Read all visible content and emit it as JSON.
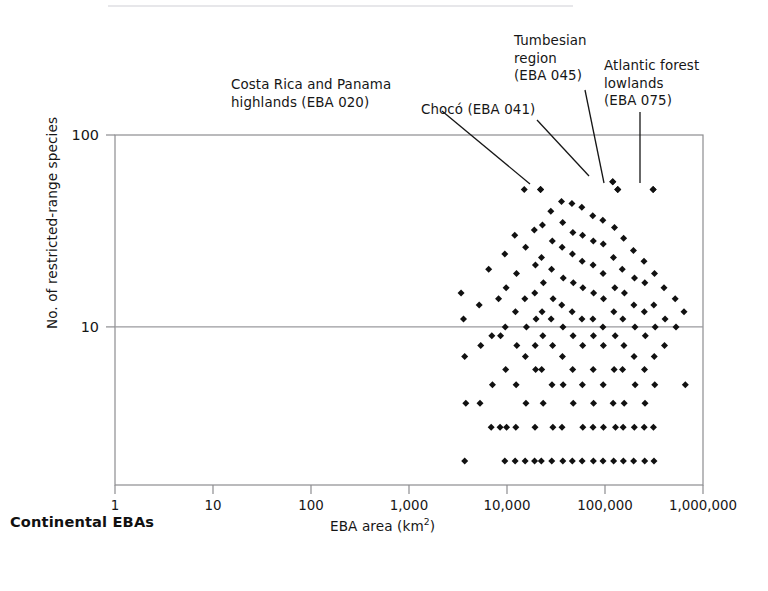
{
  "figure": {
    "corner_caption": "Continental EBAs",
    "frame": {
      "left": 115,
      "top": 135,
      "right": 703,
      "bottom": 485
    },
    "colors": {
      "marker": "#111111",
      "frame": "#8d8d90",
      "gridline": "#9a9a9e",
      "leader": "#161616",
      "text": "#161616",
      "background": "#ffffff",
      "scan_artifact": "#e7e7ea"
    }
  },
  "chart_data": {
    "type": "scatter",
    "title": "",
    "subtitle": "",
    "xlabel": "EBA area (km2)",
    "xlabel_base": "EBA area (km",
    "xlabel_sup": "2",
    "xlabel_tail": ")",
    "ylabel": "No. of restricted-range species",
    "xscale": "log",
    "yscale": "log",
    "xlim": [
      1,
      1000000
    ],
    "ylim": [
      1.5,
      100
    ],
    "xticks": [
      1,
      10,
      100,
      1000,
      10000,
      100000,
      1000000
    ],
    "xtick_labels": [
      "1",
      "10",
      "100",
      "1,000",
      "10,000",
      "100,000",
      "1,000,000"
    ],
    "yticks": [
      10,
      100
    ],
    "ytick_labels": [
      "10",
      "100"
    ],
    "grid": "horizontal-at-y-10",
    "legend": null,
    "legend_position": "none",
    "marker_symbol": "diamond",
    "marker_size_px": 7,
    "n_points": 124,
    "annotations": [
      {
        "id": "costa-rica-panama-highlands",
        "text": "Costa Rica and Panama\nhighlands (EBA 020)",
        "eba_code": "EBA 020",
        "point": {
          "x": 22000,
          "y": 52
        },
        "leader_px": [
          [
            442,
            111
          ],
          [
            530,
            184
          ]
        ]
      },
      {
        "id": "choco",
        "text": "Chocó (EBA 041)",
        "eba_code": "EBA 041",
        "point": {
          "x": 120000,
          "y": 57
        },
        "leader_px": [
          [
            537,
            120
          ],
          [
            589,
            176
          ]
        ]
      },
      {
        "id": "tumbesian-region",
        "text": "Tumbesian\nregion\n(EBA 045)",
        "eba_code": "EBA 045",
        "point": {
          "x": 135000,
          "y": 52
        },
        "leader_px": [
          [
            585,
            90
          ],
          [
            604,
            183
          ]
        ]
      },
      {
        "id": "atlantic-forest-lowlands",
        "text": "Atlantic forest\nlowlands\n(EBA 075)",
        "eba_code": "EBA 075",
        "point": {
          "x": 310000,
          "y": 52
        },
        "leader_px": [
          [
            640,
            112
          ],
          [
            640,
            183
          ]
        ]
      }
    ],
    "points": [
      [
        3400,
        15
      ],
      [
        3600,
        11
      ],
      [
        3700,
        7
      ],
      [
        3800,
        4
      ],
      [
        3700,
        2
      ],
      [
        5200,
        13
      ],
      [
        5400,
        8
      ],
      [
        5300,
        4
      ],
      [
        6500,
        20
      ],
      [
        7000,
        9
      ],
      [
        7100,
        5
      ],
      [
        6900,
        3
      ],
      [
        8200,
        14
      ],
      [
        8600,
        9
      ],
      [
        8500,
        3
      ],
      [
        9500,
        24
      ],
      [
        9800,
        16
      ],
      [
        9600,
        10
      ],
      [
        9700,
        6
      ],
      [
        9900,
        3
      ],
      [
        9500,
        2
      ],
      [
        12000,
        30
      ],
      [
        12500,
        19
      ],
      [
        12200,
        12
      ],
      [
        12600,
        8
      ],
      [
        12400,
        5
      ],
      [
        12300,
        3
      ],
      [
        12100,
        2
      ],
      [
        15000,
        52
      ],
      [
        15500,
        26
      ],
      [
        15200,
        14
      ],
      [
        15800,
        10
      ],
      [
        15400,
        7
      ],
      [
        15600,
        4
      ],
      [
        15300,
        2
      ],
      [
        19000,
        32
      ],
      [
        19500,
        21
      ],
      [
        19200,
        15
      ],
      [
        19800,
        11
      ],
      [
        19400,
        8
      ],
      [
        19600,
        6
      ],
      [
        19300,
        3
      ],
      [
        19100,
        2
      ],
      [
        22000,
        52
      ],
      [
        23000,
        34
      ],
      [
        22500,
        23
      ],
      [
        23500,
        17
      ],
      [
        22800,
        12
      ],
      [
        23200,
        9
      ],
      [
        22600,
        6
      ],
      [
        23400,
        4
      ],
      [
        22400,
        2
      ],
      [
        28000,
        40
      ],
      [
        29000,
        28
      ],
      [
        28500,
        20
      ],
      [
        29500,
        14
      ],
      [
        28200,
        11
      ],
      [
        29200,
        8
      ],
      [
        28800,
        5
      ],
      [
        29400,
        3
      ],
      [
        28600,
        2
      ],
      [
        36000,
        45
      ],
      [
        37000,
        35
      ],
      [
        36500,
        26
      ],
      [
        37500,
        18
      ],
      [
        36200,
        13
      ],
      [
        37200,
        10
      ],
      [
        36800,
        7
      ],
      [
        37400,
        5
      ],
      [
        36400,
        3
      ],
      [
        37100,
        2
      ],
      [
        46000,
        44
      ],
      [
        47000,
        31
      ],
      [
        46500,
        24
      ],
      [
        47500,
        17
      ],
      [
        46200,
        12
      ],
      [
        47200,
        9
      ],
      [
        46800,
        6
      ],
      [
        47400,
        4
      ],
      [
        46400,
        2
      ],
      [
        58000,
        42
      ],
      [
        59000,
        30
      ],
      [
        58500,
        22
      ],
      [
        59500,
        16
      ],
      [
        58200,
        11
      ],
      [
        59200,
        8
      ],
      [
        58800,
        5
      ],
      [
        59400,
        3
      ],
      [
        58400,
        2
      ],
      [
        75000,
        38
      ],
      [
        76000,
        28
      ],
      [
        75500,
        21
      ],
      [
        76500,
        15
      ],
      [
        75200,
        11
      ],
      [
        76200,
        9
      ],
      [
        75800,
        6
      ],
      [
        76400,
        4
      ],
      [
        75400,
        3
      ],
      [
        76100,
        2
      ],
      [
        95000,
        36
      ],
      [
        96000,
        27
      ],
      [
        95500,
        19
      ],
      [
        96500,
        14
      ],
      [
        95200,
        10
      ],
      [
        96200,
        8
      ],
      [
        95800,
        5
      ],
      [
        96400,
        3
      ],
      [
        95400,
        2
      ],
      [
        120000,
        57
      ],
      [
        125000,
        33
      ],
      [
        122000,
        23
      ],
      [
        126000,
        16
      ],
      [
        123000,
        12
      ],
      [
        127000,
        9
      ],
      [
        124000,
        6
      ],
      [
        121000,
        4
      ],
      [
        128000,
        3
      ],
      [
        122500,
        2
      ],
      [
        135000,
        52
      ],
      [
        155000,
        29
      ],
      [
        150000,
        20
      ],
      [
        158000,
        15
      ],
      [
        152000,
        11
      ],
      [
        156000,
        8
      ],
      [
        151000,
        6
      ],
      [
        157000,
        4
      ],
      [
        153000,
        3
      ],
      [
        154000,
        2
      ],
      [
        195000,
        25
      ],
      [
        200000,
        18
      ],
      [
        197000,
        13
      ],
      [
        202000,
        10
      ],
      [
        198000,
        7
      ],
      [
        203000,
        5
      ],
      [
        199000,
        3
      ],
      [
        196000,
        2
      ],
      [
        250000,
        22
      ],
      [
        255000,
        17
      ],
      [
        252000,
        12
      ],
      [
        258000,
        9
      ],
      [
        253000,
        6
      ],
      [
        256000,
        4
      ],
      [
        251000,
        3
      ],
      [
        254000,
        2
      ],
      [
        310000,
        52
      ],
      [
        320000,
        19
      ],
      [
        315000,
        13
      ],
      [
        325000,
        10
      ],
      [
        318000,
        7
      ],
      [
        322000,
        5
      ],
      [
        312000,
        3
      ],
      [
        316000,
        2
      ],
      [
        400000,
        16
      ],
      [
        410000,
        11
      ],
      [
        405000,
        8
      ],
      [
        520000,
        14
      ],
      [
        530000,
        10
      ],
      [
        640000,
        12
      ],
      [
        660000,
        5
      ]
    ]
  }
}
